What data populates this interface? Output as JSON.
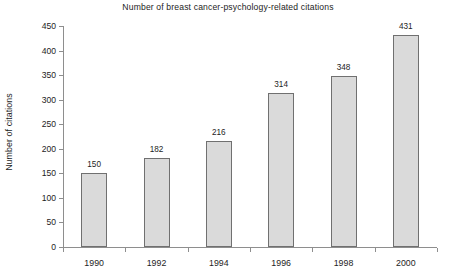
{
  "chart_data": {
    "type": "bar",
    "title": "Number of breast cancer-psychology-related citations",
    "xlabel": "",
    "ylabel": "Number of citations",
    "categories": [
      "1990",
      "1992",
      "1994",
      "1996",
      "1998",
      "2000"
    ],
    "values": [
      150,
      182,
      216,
      314,
      348,
      431
    ],
    "value_labels": [
      "150",
      "182",
      "216",
      "314",
      "348",
      "431"
    ],
    "ylim": [
      0,
      450
    ],
    "ytick_labels": [
      "0",
      "50",
      "100",
      "150",
      "200",
      "250",
      "300",
      "350",
      "400",
      "450"
    ],
    "ytick_values": [
      0,
      50,
      100,
      150,
      200,
      250,
      300,
      350,
      400,
      450
    ],
    "ytick_step": 50,
    "grid": false,
    "legend": null,
    "legend_position": "none",
    "series": [
      {
        "name": "Citations",
        "values": [
          150,
          182,
          216,
          314,
          348,
          431
        ],
        "bar_fill": "#dadada",
        "bar_border": "#707070"
      }
    ],
    "axis_color": "#8e8e8e",
    "background": "#ffffff",
    "text_color": "#1d1d1d"
  }
}
